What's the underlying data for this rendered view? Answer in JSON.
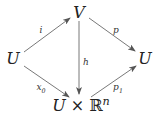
{
  "diagram": {
    "type": "commutative-diagram",
    "nodes": {
      "left": {
        "label": "U"
      },
      "top": {
        "label": "V"
      },
      "right": {
        "label": "U"
      },
      "bottom": {
        "base": "U",
        "times": "×",
        "field": "ℝ",
        "exp": "n"
      }
    },
    "arrows": {
      "i": {
        "from": "left",
        "to": "top",
        "label": "i"
      },
      "p": {
        "from": "top",
        "to": "right",
        "label": "p"
      },
      "h": {
        "from": "top",
        "to": "bottom",
        "label": "h"
      },
      "x0": {
        "from": "left",
        "to": "bottom",
        "label": "x",
        "sub": "0"
      },
      "p1": {
        "from": "bottom",
        "to": "right",
        "label": "p",
        "sub": "1"
      }
    },
    "colors": {
      "stroke": "#555555",
      "text": "#222222"
    }
  }
}
